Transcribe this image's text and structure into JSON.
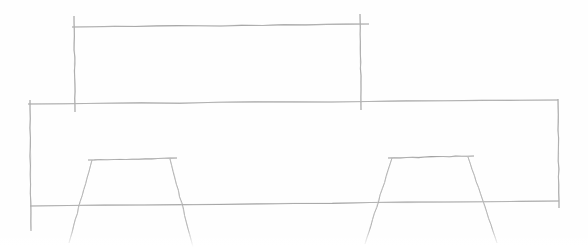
{
  "canvas": {
    "width": 588,
    "height": 247,
    "background_color": "#fefefe",
    "title": "hand-drawn line sketch"
  },
  "style": {
    "ink_color": "#9a9a9a",
    "ink_color_light": "#b6b6b6",
    "ink_color_faint": "#cfcfcf",
    "stroke_width_main": 1.1,
    "stroke_width_thin": 0.9
  },
  "drawing": {
    "name": "elevation-sketch-with-dimension",
    "description": "Hand drawn side elevation: a wide flat body outlined as a long shallow rectangle, with two splayed trapezoidal leg assemblies beneath it, and a dimension line with end ticks drawn above spanning between the two uprights.",
    "groups": [
      {
        "name": "dimension-line-group",
        "label": "upper dimension bracket",
        "strokes": [
          {
            "name": "dimension-horizontal-line",
            "kind": "line",
            "points": [
              [
                72,
                27
              ],
              [
                369,
                24
              ]
            ],
            "color": "#9a9a9a",
            "width": 1.1
          },
          {
            "name": "dimension-left-extension-line",
            "kind": "line",
            "points": [
              [
                74,
                16
              ],
              [
                75,
                112
              ]
            ],
            "color": "#9a9a9a",
            "width": 1.1
          },
          {
            "name": "dimension-right-extension-line",
            "kind": "line",
            "points": [
              [
                360,
                14
              ],
              [
                361,
                110
              ]
            ],
            "color": "#9a9a9a",
            "width": 1.1
          }
        ]
      },
      {
        "name": "body-outline-group",
        "label": "main body rectangle",
        "strokes": [
          {
            "name": "body-top-edge",
            "kind": "line",
            "points": [
              [
                28,
                104
              ],
              [
                558,
                100
              ]
            ],
            "color": "#9a9a9a",
            "width": 1.1
          },
          {
            "name": "body-bottom-edge",
            "kind": "line",
            "points": [
              [
                30,
                206
              ],
              [
                559,
                201
              ]
            ],
            "color": "#9a9a9a",
            "width": 1.1
          },
          {
            "name": "body-left-edge",
            "kind": "line",
            "points": [
              [
                30,
                100
              ],
              [
                31,
                231
              ]
            ],
            "color": "#9a9a9a",
            "width": 1.1
          },
          {
            "name": "body-right-edge",
            "kind": "line",
            "points": [
              [
                558,
                99
              ],
              [
                559,
                208
              ]
            ],
            "color": "#9a9a9a",
            "width": 1.1
          }
        ]
      },
      {
        "name": "left-leg-group",
        "label": "left splayed leg assembly",
        "strokes": [
          {
            "name": "left-leg-top-rail",
            "kind": "line",
            "points": [
              [
                88,
                160
              ],
              [
                177,
                158
              ]
            ],
            "color": "#9a9a9a",
            "width": 1.1
          },
          {
            "name": "left-leg-outer-strut",
            "kind": "line",
            "points": [
              [
                92,
                160
              ],
              [
                69,
                243
              ]
            ],
            "color": "#a8a8a8",
            "width": 1.0
          },
          {
            "name": "left-leg-inner-strut",
            "kind": "line",
            "points": [
              [
                170,
                159
              ],
              [
                193,
                247
              ]
            ],
            "color": "#a8a8a8",
            "width": 1.0
          }
        ]
      },
      {
        "name": "right-leg-group",
        "label": "right splayed leg assembly",
        "strokes": [
          {
            "name": "right-leg-top-rail",
            "kind": "line",
            "points": [
              [
                388,
                158
              ],
              [
                474,
                156
              ]
            ],
            "color": "#9a9a9a",
            "width": 1.1
          },
          {
            "name": "right-leg-outer-strut",
            "kind": "line",
            "points": [
              [
                392,
                158
              ],
              [
                365,
                244
              ]
            ],
            "color": "#a8a8a8",
            "width": 1.0
          },
          {
            "name": "right-leg-inner-strut",
            "kind": "line",
            "points": [
              [
                468,
                157
              ],
              [
                497,
                243
              ]
            ],
            "color": "#a8a8a8",
            "width": 1.0
          }
        ]
      }
    ]
  }
}
